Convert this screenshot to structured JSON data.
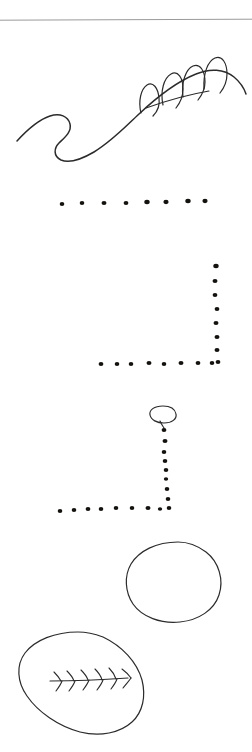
{
  "page": {
    "title": "Hand-drawn sketch page",
    "width": 252,
    "height": 752,
    "background_color": "#ffffff",
    "ink_color": "#2b2b2b",
    "dot_color": "#14120f",
    "divider_color": "#9a9a9a"
  },
  "divider": {
    "label": "horizontal rule",
    "y": 20,
    "x_start": 0,
    "x_end": 252
  },
  "figures": [
    {
      "id": "wave-with-arches",
      "label": "wavy line with four arch loops",
      "arch_count": 4,
      "bounds": {
        "x": 17,
        "y": 30,
        "width": 228,
        "height": 110
      }
    },
    {
      "id": "diagonal-stroke",
      "label": "short diagonal stroke",
      "bounds": {
        "x": 143,
        "y": 90,
        "width": 67,
        "height": 20
      }
    },
    {
      "id": "dotted-row",
      "label": "horizontal dotted line",
      "dot_count": 8,
      "bounds": {
        "x": 58,
        "y": 198,
        "width": 150,
        "height": 10
      }
    },
    {
      "id": "dotted-corner-upper",
      "label": "L-shaped dotted path",
      "dot_count": 17,
      "bounds": {
        "x": 98,
        "y": 262,
        "width": 122,
        "height": 104
      }
    },
    {
      "id": "ellipse-head",
      "label": "small ellipse marker",
      "bounds": {
        "x": 150,
        "y": 405,
        "width": 26,
        "height": 18
      }
    },
    {
      "id": "dotted-corner-lower",
      "label": "L-shaped dotted path with ellipse",
      "dot_count": 17,
      "bounds": {
        "x": 56,
        "y": 424,
        "width": 118,
        "height": 66
      }
    },
    {
      "id": "blob-plain",
      "label": "rounded blob outline",
      "bounds": {
        "x": 126,
        "y": 541,
        "width": 96,
        "height": 82
      }
    },
    {
      "id": "blob-feather",
      "label": "oval blob containing feather motif",
      "chevron_count": 6,
      "bounds": {
        "x": 18,
        "y": 631,
        "width": 128,
        "height": 105
      }
    }
  ],
  "dots": {
    "row": [
      {
        "cx": 62,
        "cy": 204,
        "r": 2.3
      },
      {
        "cx": 82,
        "cy": 203,
        "r": 2.3
      },
      {
        "cx": 104,
        "cy": 203,
        "r": 2.5
      },
      {
        "cx": 126,
        "cy": 203,
        "r": 2.4
      },
      {
        "cx": 147,
        "cy": 202,
        "r": 2.7
      },
      {
        "cx": 166,
        "cy": 202,
        "r": 2.6
      },
      {
        "cx": 188,
        "cy": 201,
        "r": 2.7
      },
      {
        "cx": 205,
        "cy": 201,
        "r": 2.6
      }
    ],
    "corner_upper_vertical": [
      {
        "cx": 216,
        "cy": 266,
        "r": 2.7
      },
      {
        "cx": 215,
        "cy": 281,
        "r": 2.5
      },
      {
        "cx": 215,
        "cy": 295,
        "r": 2.4
      },
      {
        "cx": 217,
        "cy": 309,
        "r": 2.4
      },
      {
        "cx": 216,
        "cy": 323,
        "r": 2.5
      },
      {
        "cx": 217,
        "cy": 337,
        "r": 2.5
      },
      {
        "cx": 217,
        "cy": 350,
        "r": 2.5
      },
      {
        "cx": 218,
        "cy": 362,
        "r": 2.4
      }
    ],
    "corner_upper_horizontal": [
      {
        "cx": 101,
        "cy": 364,
        "r": 2.4
      },
      {
        "cx": 117,
        "cy": 364,
        "r": 2.3
      },
      {
        "cx": 131,
        "cy": 364,
        "r": 2.3
      },
      {
        "cx": 149,
        "cy": 363,
        "r": 2.5
      },
      {
        "cx": 164,
        "cy": 364,
        "r": 2.3
      },
      {
        "cx": 181,
        "cy": 363,
        "r": 2.5
      },
      {
        "cx": 198,
        "cy": 363,
        "r": 2.4
      },
      {
        "cx": 212,
        "cy": 363,
        "r": 2.3
      }
    ],
    "corner_lower_vertical": [
      {
        "cx": 164,
        "cy": 430,
        "r": 2.4
      },
      {
        "cx": 165,
        "cy": 441,
        "r": 2.5
      },
      {
        "cx": 164,
        "cy": 452,
        "r": 2.3
      },
      {
        "cx": 165,
        "cy": 461,
        "r": 2.3
      },
      {
        "cx": 166,
        "cy": 470,
        "r": 2.3
      },
      {
        "cx": 166,
        "cy": 479,
        "r": 2.2
      },
      {
        "cx": 167,
        "cy": 489,
        "r": 2.3
      },
      {
        "cx": 168,
        "cy": 499,
        "r": 2.3
      },
      {
        "cx": 169,
        "cy": 508,
        "r": 2.3
      }
    ],
    "corner_lower_horizontal": [
      {
        "cx": 60,
        "cy": 511,
        "r": 2.3
      },
      {
        "cx": 74,
        "cy": 510,
        "r": 2.3
      },
      {
        "cx": 88,
        "cy": 509,
        "r": 2.4
      },
      {
        "cx": 101,
        "cy": 509,
        "r": 2.3
      },
      {
        "cx": 116,
        "cy": 508,
        "r": 2.3
      },
      {
        "cx": 132,
        "cy": 508,
        "r": 2.3
      },
      {
        "cx": 148,
        "cy": 508,
        "r": 2.5
      },
      {
        "cx": 160,
        "cy": 509,
        "r": 2.2
      }
    ]
  }
}
